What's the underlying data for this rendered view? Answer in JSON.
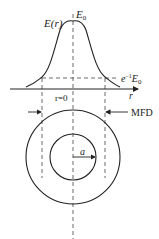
{
  "diagram": {
    "labels": {
      "field_profile": "E(r)",
      "peak": "E",
      "peak_sub": "0",
      "threshold_e": "e",
      "threshold_exp": "−1",
      "threshold_E": "E",
      "threshold_sub": "0",
      "axis_var": "r",
      "origin": "r=0",
      "mfd": "MFD",
      "core_radius": "a"
    },
    "colors": {
      "ink": "#222222",
      "dash": "#444444"
    }
  }
}
